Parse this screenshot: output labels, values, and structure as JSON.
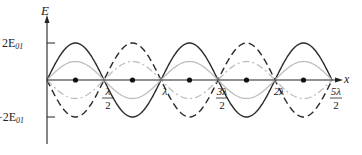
{
  "figure": {
    "axes": {
      "y_label": "E",
      "x_label": "x",
      "y_ticks": [
        {
          "label": "2E",
          "sub": "01",
          "value": 2
        },
        {
          "label": "−2E",
          "sub": "01",
          "value": -2
        }
      ],
      "x_ticks": [
        {
          "num": "λ",
          "den": "2"
        },
        {
          "num": "λ",
          "den": ""
        },
        {
          "num": "3λ",
          "den": "2"
        },
        {
          "num": "2λ",
          "den": ""
        },
        {
          "num": "5λ",
          "den": "2"
        }
      ]
    },
    "curves": [
      {
        "name": "solid-envelope",
        "style": "solid",
        "color": "#2a2a2a",
        "amplitude": 2
      },
      {
        "name": "dashed-envelope",
        "style": "dashed",
        "color": "#2a2a2a",
        "amplitude": -2
      },
      {
        "name": "gray-solid",
        "style": "solid",
        "color": "#bdbdbd",
        "amplitude": 1
      },
      {
        "name": "gray-dashdot",
        "style": "dashdot",
        "color": "#bdbdbd",
        "amplitude": -1
      }
    ],
    "antinode_markers": 5,
    "node_count": 6
  }
}
